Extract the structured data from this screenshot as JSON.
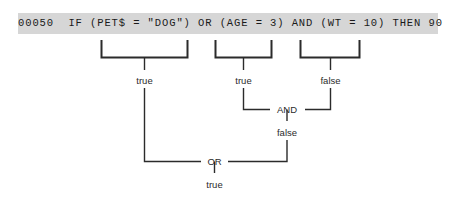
{
  "code_line": {
    "text": "00050  IF (PET$ = \"DOG\") OR (AGE = 3) AND (WT = 10) THEN 90",
    "line_number": "00050",
    "statement": "IF (PET$ = \"DOG\") OR (AGE = 3) AND (WT = 10) THEN 90",
    "bar_color": "#d6d6d6"
  },
  "evaluation_tree": {
    "conditions": [
      {
        "expression": "(PET$ = \"DOG\")",
        "result": "true"
      },
      {
        "expression": "(AGE = 3)",
        "result": "true"
      },
      {
        "expression": "(WT = 10)",
        "result": "false"
      }
    ],
    "operators": [
      {
        "label": "AND",
        "operands": [
          "true",
          "false"
        ],
        "result": "false"
      },
      {
        "label": "OR",
        "operands": [
          "true",
          "false"
        ],
        "result": "true"
      }
    ],
    "final_result": "true",
    "line_color": "#2b2b2b"
  },
  "labels": {
    "cond1_result": "true",
    "cond2_result": "true",
    "cond3_result": "false",
    "and_op": "AND",
    "and_result": "false",
    "or_op": "OR",
    "or_result": "true"
  }
}
